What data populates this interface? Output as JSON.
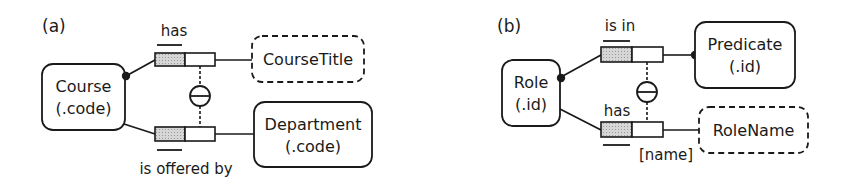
{
  "panels": [
    {
      "label": "(a)",
      "entities": {
        "main": {
          "name": "Course",
          "ref": "(.code)"
        },
        "top": {
          "name": "CourseTitle",
          "kind": "value-type"
        },
        "bottom": {
          "name": "Department",
          "ref": "(.code)"
        }
      },
      "facts": {
        "top_reading": "has",
        "bottom_reading": "is offered by"
      },
      "constraint": "exclusion"
    },
    {
      "label": "(b)",
      "entities": {
        "main": {
          "name": "Role",
          "ref": "(.id)"
        },
        "top": {
          "name": "Predicate",
          "ref": "(.id)"
        },
        "bottom": {
          "name": "RoleName",
          "kind": "value-type"
        }
      },
      "facts": {
        "top_reading": "is in",
        "bottom_reading": "has",
        "bottom_role_name": "[name]"
      },
      "constraint": "exclusion"
    }
  ],
  "colors": {
    "stroke": "#1a1a1a",
    "shade": "#c8c8c8"
  }
}
